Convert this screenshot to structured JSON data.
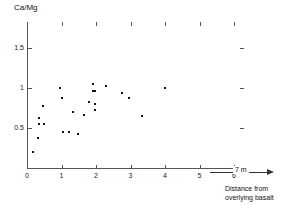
{
  "figure": {
    "y_axis_title": "Ca/Mg",
    "x_axis_title_line1": "Distance from",
    "x_axis_title_line2": "overlying basalt",
    "scale_label": "7 m"
  },
  "axes": {
    "x_ticks": [
      "0",
      "1",
      "2",
      "3",
      "4",
      "5",
      "6"
    ],
    "y_ticks": [
      "0.5",
      "1",
      "1.5"
    ]
  },
  "chart_data": {
    "type": "scatter",
    "title": "",
    "xlabel": "Distance from overlying basalt",
    "ylabel": "Ca/Mg",
    "xlim": [
      0,
      6
    ],
    "ylim": [
      0,
      1.75
    ],
    "xticks": [
      0,
      1,
      2,
      3,
      4,
      5,
      6
    ],
    "yticks": [
      0.5,
      1,
      1.5
    ],
    "grid": false,
    "legend": null,
    "annotations": [
      {
        "text": "7 m",
        "kind": "scale-bar-with-arrow",
        "position": "below-x-axis-right"
      }
    ],
    "series": [
      {
        "name": "Ca/Mg ratio",
        "marker": "dot",
        "color": "#111111",
        "points": [
          {
            "x": 0.17,
            "y": 0.2
          },
          {
            "x": 0.31,
            "y": 0.37
          },
          {
            "x": 0.34,
            "y": 0.62
          },
          {
            "x": 0.34,
            "y": 0.55
          },
          {
            "x": 0.45,
            "y": 0.78
          },
          {
            "x": 0.48,
            "y": 0.55
          },
          {
            "x": 0.97,
            "y": 1.0
          },
          {
            "x": 1.0,
            "y": 0.88
          },
          {
            "x": 1.03,
            "y": 0.45
          },
          {
            "x": 1.22,
            "y": 0.45
          },
          {
            "x": 1.33,
            "y": 0.7
          },
          {
            "x": 1.48,
            "y": 0.42
          },
          {
            "x": 1.66,
            "y": 0.66
          },
          {
            "x": 1.9,
            "y": 1.05
          },
          {
            "x": 1.9,
            "y": 0.96
          },
          {
            "x": 1.96,
            "y": 0.96
          },
          {
            "x": 1.96,
            "y": 0.8
          },
          {
            "x": 1.97,
            "y": 0.72
          },
          {
            "x": 1.8,
            "y": 0.82
          },
          {
            "x": 2.3,
            "y": 1.02
          },
          {
            "x": 2.75,
            "y": 0.94
          },
          {
            "x": 2.97,
            "y": 0.87
          },
          {
            "x": 3.34,
            "y": 0.65
          },
          {
            "x": 4.0,
            "y": 1.0
          }
        ]
      }
    ]
  }
}
